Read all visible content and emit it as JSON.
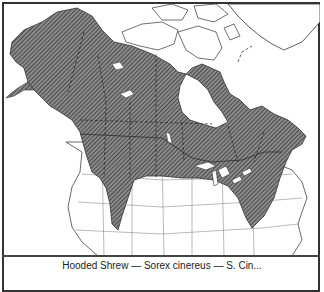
{
  "map": {
    "title": "Range map of North America",
    "legend": {
      "shaded_area": "Species range",
      "fill_pattern": "diagonal-hatch",
      "fill_color": "#555555",
      "background_color": "#ffffff",
      "border_color": "#333333"
    },
    "regions_shaded": [
      "Alaska",
      "Yukon",
      "Northwest Territories",
      "British Columbia",
      "Alberta",
      "Saskatchewan",
      "Manitoba",
      "Ontario",
      "Quebec",
      "Labrador",
      "Maritime Provinces",
      "Northern United States",
      "Rocky Mountains extension",
      "Appalachian extension"
    ],
    "regions_unshaded": [
      "Arctic Archipelago",
      "Greenland",
      "Hudson Bay",
      "Western United States",
      "Southern United States"
    ]
  },
  "caption": {
    "text": "Hooded Shrew — Sorex cinereus — S. Cin..."
  }
}
